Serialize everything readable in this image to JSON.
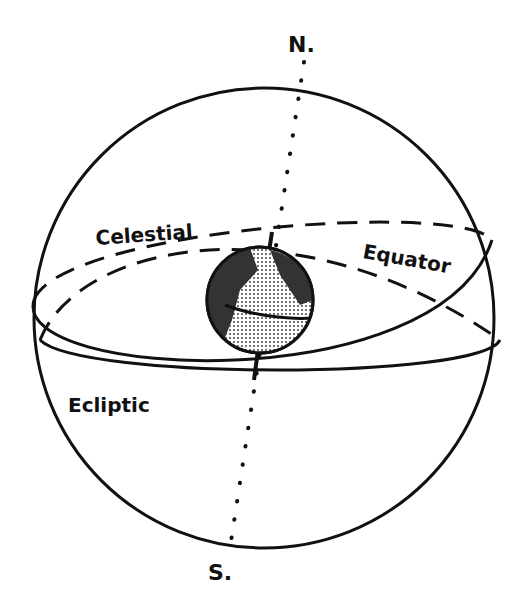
{
  "diagram": {
    "type": "celestial-sphere",
    "labels": {
      "north": "N.",
      "south": "S.",
      "celestial": "Celestial",
      "equator": "Equator",
      "ecliptic": "Ecliptic"
    },
    "components": [
      "celestial sphere",
      "earth globe at center",
      "celestial equator (dashed back half, solid front)",
      "ecliptic (tilted great circle)",
      "polar axis (dotted) from N to S"
    ],
    "colors": {
      "ink": "#111111",
      "background": "#ffffff",
      "globe_fill": "#cfcfcf"
    }
  }
}
